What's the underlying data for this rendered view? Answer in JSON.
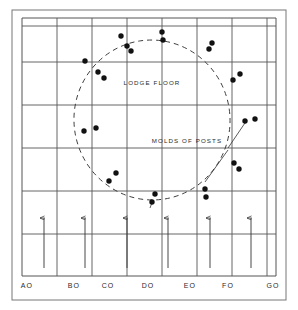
{
  "figure": {
    "background_color": "#ffffff",
    "ink_color": "#2a2a2a",
    "dot_color": "#111111"
  },
  "annotations": {
    "lodge_floor": "LODGE FLOOR",
    "molds_of_posts": "MOLDS OF POSTS"
  },
  "axis": {
    "labels": [
      "AO",
      "BO",
      "CO",
      "DO",
      "EO",
      "FO",
      "GO"
    ],
    "label_x": [
      27,
      74,
      108,
      148,
      190,
      228,
      273
    ],
    "label_y": 288
  },
  "grid": {
    "frame": {
      "x": 12,
      "y": 10,
      "width": 274,
      "height": 290
    },
    "inner": {
      "x": 22,
      "y": 18,
      "width": 254,
      "height": 258
    },
    "vertical_x": [
      22,
      57,
      92,
      127,
      162,
      197,
      232,
      267,
      276
    ],
    "horizontal_y": [
      18,
      26,
      62,
      105,
      148,
      191,
      234,
      276
    ],
    "line_color": "#555555",
    "grid_on": true
  },
  "arrows": {
    "count": 6,
    "x_positions": [
      44,
      85,
      127,
      168,
      210,
      251
    ],
    "y_top": 218,
    "y_bottom": 268,
    "color": "#333333",
    "direction": "up"
  },
  "lodge_outline": {
    "type": "dashed-ellipse",
    "center_x": 152,
    "center_y": 120,
    "radius_x": 78,
    "radius_y": 80,
    "rotation_deg": -8,
    "dash": "5 4",
    "color": "#333333"
  },
  "leader_lines": [
    {
      "name": "molds-of-posts-leader-upper",
      "x1": 228,
      "y1": 148,
      "x2": 247,
      "y2": 120
    },
    {
      "name": "molds-of-posts-leader-lower",
      "x1": 228,
      "y1": 150,
      "x2": 205,
      "y2": 182
    },
    {
      "name": "post-mold-tick-bottom",
      "x1": 153,
      "y1": 200,
      "x2": 150,
      "y2": 208
    }
  ],
  "post_molds": {
    "label": "Molds of posts",
    "count": 26,
    "radius": 2.7,
    "points": [
      {
        "x": 121,
        "y": 36
      },
      {
        "x": 127,
        "y": 46
      },
      {
        "x": 131,
        "y": 51
      },
      {
        "x": 162,
        "y": 32
      },
      {
        "x": 163,
        "y": 40
      },
      {
        "x": 212,
        "y": 43
      },
      {
        "x": 209,
        "y": 49
      },
      {
        "x": 85,
        "y": 61
      },
      {
        "x": 98,
        "y": 72
      },
      {
        "x": 104,
        "y": 78
      },
      {
        "x": 240,
        "y": 74
      },
      {
        "x": 233,
        "y": 80
      },
      {
        "x": 84,
        "y": 131
      },
      {
        "x": 96,
        "y": 128
      },
      {
        "x": 245,
        "y": 121
      },
      {
        "x": 255,
        "y": 119
      },
      {
        "x": 234,
        "y": 163
      },
      {
        "x": 239,
        "y": 169
      },
      {
        "x": 109,
        "y": 181
      },
      {
        "x": 116,
        "y": 173
      },
      {
        "x": 155,
        "y": 194
      },
      {
        "x": 152,
        "y": 202
      },
      {
        "x": 205,
        "y": 189
      },
      {
        "x": 206,
        "y": 197
      }
    ]
  }
}
